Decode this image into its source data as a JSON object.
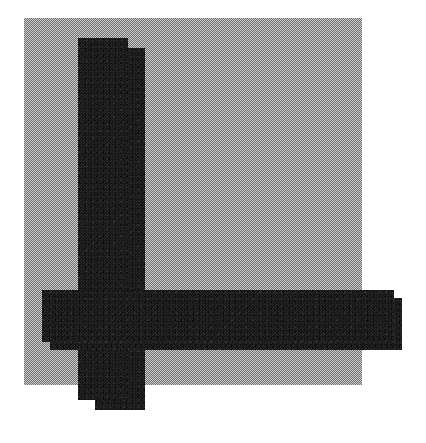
{
  "artwork": {
    "title": "Abstract Geometric Composition",
    "canvas": {
      "width": 426,
      "height": 443,
      "background_color": "#ffffff"
    },
    "palette": {
      "paper_white": "#ffffff",
      "dither_gray_light": "#cfcfcf",
      "dither_gray_dark": "#6e6e6e",
      "gray_average": "#9a9a9a",
      "bar_black": "#1b1b1b",
      "bar_black_highlight": "#2c2c2c",
      "bar_black_shadow": "#0a0a0a"
    },
    "shapes": [
      {
        "id": "gray-square",
        "role": "background-field",
        "fill": "dithered-gray-checkerboard",
        "x": 24,
        "y": 18,
        "width": 338,
        "height": 367
      },
      {
        "id": "vertical-bar-back",
        "role": "vertical-stroke-offset",
        "fill": "textured-black",
        "x": 95,
        "y": 48,
        "width": 50,
        "height": 362
      },
      {
        "id": "vertical-bar-front",
        "role": "vertical-stroke-main",
        "fill": "textured-black",
        "x": 78,
        "y": 38,
        "width": 50,
        "height": 362
      },
      {
        "id": "horizontal-bar-back",
        "role": "horizontal-stroke-offset",
        "fill": "textured-black",
        "x": 50,
        "y": 298,
        "width": 352,
        "height": 52
      },
      {
        "id": "horizontal-bar-front",
        "role": "horizontal-stroke-main",
        "fill": "textured-black",
        "x": 42,
        "y": 290,
        "width": 352,
        "height": 52
      }
    ]
  }
}
